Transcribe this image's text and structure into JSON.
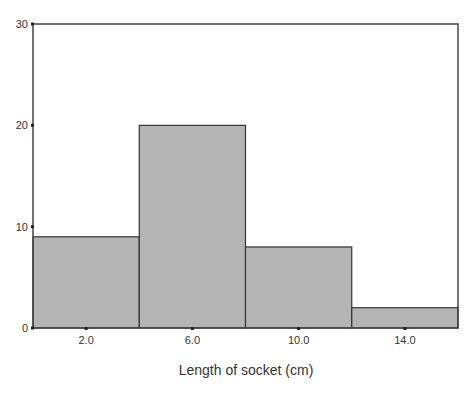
{
  "chart_data": {
    "type": "bar",
    "subtype": "histogram",
    "title": "",
    "xlabel": "Length of socket (cm)",
    "ylabel": "",
    "categories": [
      "2.0",
      "6.0",
      "10.0",
      "14.0"
    ],
    "bin_edges": [
      0,
      4,
      8,
      12,
      16
    ],
    "values": [
      9,
      20,
      8,
      2
    ],
    "ylim": [
      0,
      30
    ],
    "yticks": [
      0,
      10,
      20,
      30
    ],
    "xlim": [
      0,
      16
    ],
    "grid": false,
    "legend": null
  },
  "colors": {
    "bar_fill": "#b4b4b4",
    "bar_stroke": "#333333",
    "frame": "#444444"
  }
}
